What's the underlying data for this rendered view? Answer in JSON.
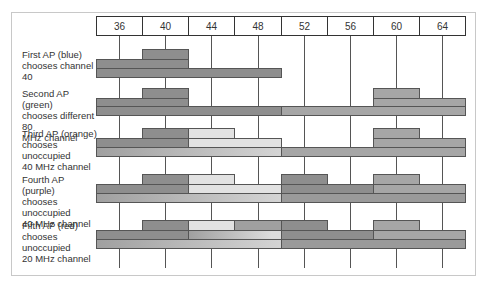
{
  "diagram": {
    "channels": [
      "36",
      "40",
      "44",
      "48",
      "52",
      "56",
      "60",
      "64"
    ],
    "rows": [
      {
        "label": "First AP (blue)\nchooses channel 40"
      },
      {
        "label": "Second AP (green)\nchooses different 80\nMHz channel"
      },
      {
        "label": "Third AP (orange)\nchooses unoccupied\n40 MHz channel"
      },
      {
        "label": "Fourth AP (purple)\nchooses unoccupied\n40 MHz channel"
      },
      {
        "label": "Fifth AP (red)\nchooses unoccupied\n20 MHz channel"
      }
    ],
    "colors": {
      "blue": "#8e8e8e",
      "green": "#a6a6a6",
      "orange": "#e2e2e2",
      "purple": "#8a8a8a",
      "red": "#a0a0a0",
      "line": "#555555"
    }
  }
}
